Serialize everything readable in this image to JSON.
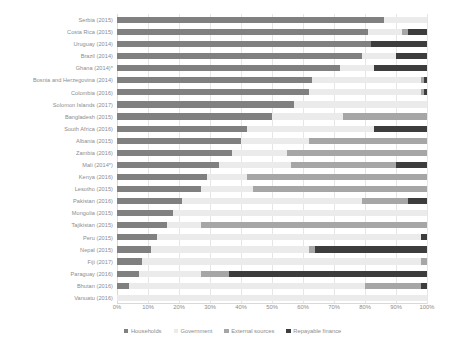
{
  "chart_data": {
    "type": "bar",
    "orientation": "horizontal",
    "stacked": true,
    "stack_mode": "percent",
    "title": "",
    "subtitle": "",
    "xlabel": "",
    "ylabel": "",
    "xlim": [
      0,
      100
    ],
    "grid": true,
    "grid_axis": "x",
    "legend_position": "bottom",
    "xticks": [
      "0%",
      "10%",
      "20%",
      "30%",
      "40%",
      "50%",
      "60%",
      "70%",
      "80%",
      "90%",
      "100%"
    ],
    "xtick_values": [
      0,
      10,
      20,
      30,
      40,
      50,
      60,
      70,
      80,
      90,
      100
    ],
    "categories": [
      "Serbia (2015)",
      "Costa Rica (2015)",
      "Uruguay (2014)",
      "Brazil (2014)",
      "Ghana (2014)*",
      "Bosnia and Herzegovina (2014)",
      "Colombia (2016)",
      "Solomon Islands (2017)",
      "Bangladesh (2015)",
      "South Africa (2016)",
      "Albania (2015)",
      "Zambia (2016)",
      "Mali (2014*)",
      "Kenya (2016)",
      "Lesotho (2015)",
      "Pakistan (2016)",
      "Mongolia (2015)",
      "Tajikistan (2015)",
      "Peru (2015)",
      "Nepal (2015)",
      "Fiji (2017)",
      "Paraguay (2016)",
      "Bhutan (2016)",
      "Vanuatu (2016)"
    ],
    "series": [
      {
        "name": "Households",
        "color": "#808080",
        "values": [
          86,
          81,
          82,
          79,
          72,
          63,
          62,
          57,
          50,
          42,
          40,
          37,
          33,
          29,
          27,
          21,
          18,
          16,
          13,
          11,
          8,
          7,
          4,
          0
        ]
      },
      {
        "name": "Government",
        "color": "#ebebeb",
        "values": [
          14,
          11,
          0,
          11,
          11,
          35,
          36,
          43,
          23,
          41,
          22,
          18,
          23,
          13,
          17,
          58,
          82,
          11,
          85,
          51,
          90,
          20,
          76,
          100
        ]
      },
      {
        "name": "External sources",
        "color": "#a6a6a6",
        "values": [
          0,
          2,
          0,
          0,
          0,
          1,
          1,
          0,
          27,
          0,
          38,
          45,
          34,
          58,
          56,
          15,
          0,
          73,
          0,
          2,
          2,
          9,
          18,
          0
        ]
      },
      {
        "name": "Repayable finance",
        "color": "#3d3d3d",
        "values": [
          0,
          6,
          18,
          10,
          17,
          1,
          1,
          0,
          0,
          17,
          0,
          0,
          10,
          0,
          0,
          6,
          0,
          0,
          2,
          36,
          0,
          64,
          2,
          0
        ]
      }
    ],
    "legend": [
      "Households",
      "Government",
      "External sources",
      "Repayable finance"
    ]
  }
}
